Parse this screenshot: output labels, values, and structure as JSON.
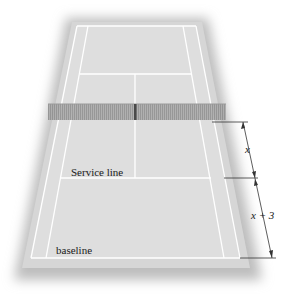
{
  "figure": {
    "type": "tennis-court-diagram",
    "labels": {
      "service_line": "Service line",
      "baseline": "baseline",
      "dim_upper": "x",
      "dim_lower": "x + 3"
    },
    "colors": {
      "court": "#dcdcdc",
      "surround": "#c8c8c8",
      "lines": "#ffffff",
      "net": "#9a9a9a",
      "dimension": "#333333"
    }
  }
}
